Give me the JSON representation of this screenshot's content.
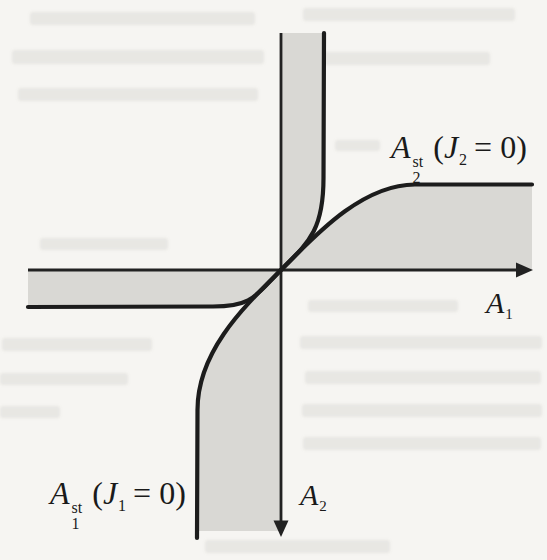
{
  "figure": {
    "type": "phase-plane-nullcline-sketch",
    "axes": {
      "x_label": {
        "base": "A",
        "sub": "1"
      },
      "y_label": {
        "base": "A",
        "sub": "2"
      }
    },
    "isoclines": {
      "iso2": {
        "base": "A",
        "sup": "st",
        "sub": "2",
        "arg_open": "(",
        "arg_var": "J",
        "arg_sub": "2",
        "arg_close": "= 0)"
      },
      "iso1": {
        "base": "A",
        "sup": "st",
        "sub": "1",
        "arg_open": "(",
        "arg_var": "J",
        "arg_sub": "1",
        "arg_close": "= 0)"
      }
    },
    "colors": {
      "paper": "#f6f5f2",
      "shade": "#d9d8d4",
      "curve": "#1c1c1c",
      "axis": "#222222",
      "text": "#1a1a1a"
    }
  }
}
